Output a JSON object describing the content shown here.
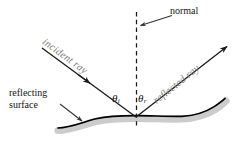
{
  "figure": {
    "background_color": "#ffffff",
    "width": 239,
    "height": 152
  },
  "labels": {
    "normal": "normal",
    "incident_ray": "incident ray",
    "reflected_ray": "reflected ray",
    "reflecting_surface_line1": "reflecting",
    "reflecting_surface_line2": "surface",
    "angle_incidence_symbol": "θ",
    "angle_incidence_subscript": "i",
    "angle_reflection_symbol": "θ",
    "angle_reflection_subscript": "r"
  },
  "colors": {
    "ray_stroke": "#1a1a1a",
    "ray_label_text": "#808080",
    "normal_line": "#1a1a1a",
    "surface_stroke": "#000000",
    "surface_shadow": "#cccccc",
    "leader_line": "#333333",
    "text": "#141414"
  },
  "geometry": {
    "incidence_point": [
      136,
      117
    ],
    "incident_ray_start": [
      42,
      48
    ],
    "incident_ray_end": [
      136,
      117
    ],
    "incident_arrow_at": [
      89,
      71
    ],
    "reflected_ray_start": [
      136,
      117
    ],
    "reflected_ray_end": [
      229,
      45
    ],
    "normal_line_top": [
      136,
      12
    ],
    "normal_line_bottom": [
      136,
      129
    ],
    "normal_leader_from": [
      168,
      14
    ],
    "normal_leader_to": [
      139,
      25
    ],
    "surface_leader_from": [
      62,
      104
    ],
    "surface_leader_to": [
      84,
      122
    ],
    "surface_span_x": [
      58,
      226
    ]
  }
}
